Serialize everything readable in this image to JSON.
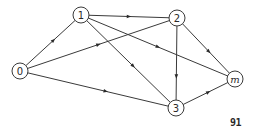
{
  "diagram": {
    "type": "directed-graph",
    "nodes": [
      {
        "id": "0",
        "label": "0",
        "italic": false
      },
      {
        "id": "1",
        "label": "1",
        "italic": false
      },
      {
        "id": "2",
        "label": "2",
        "italic": false
      },
      {
        "id": "3",
        "label": "3",
        "italic": false
      },
      {
        "id": "m",
        "label": "m",
        "italic": true
      }
    ],
    "edges": [
      {
        "from": "0",
        "to": "1"
      },
      {
        "from": "0",
        "to": "2"
      },
      {
        "from": "0",
        "to": "3"
      },
      {
        "from": "1",
        "to": "2"
      },
      {
        "from": "1",
        "to": "3"
      },
      {
        "from": "1",
        "to": "m"
      },
      {
        "from": "2",
        "to": "3"
      },
      {
        "from": "2",
        "to": "m"
      },
      {
        "from": "3",
        "to": "m"
      }
    ]
  },
  "page_number": "91"
}
